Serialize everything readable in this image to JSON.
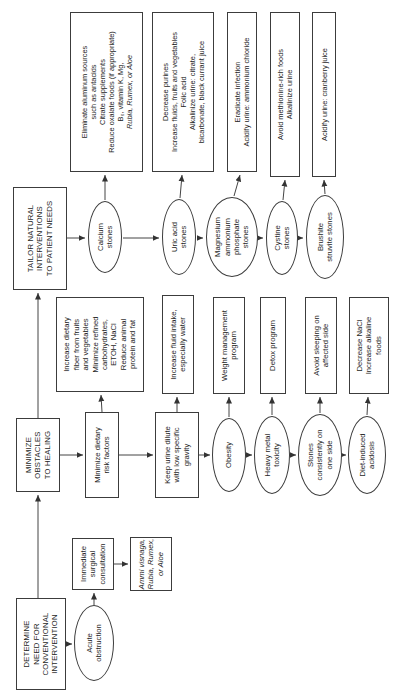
{
  "figure": {
    "background": "#ffffff",
    "line_color": "#3c3c3c"
  },
  "nodes": {
    "determine": {
      "shape": "rect",
      "lines": [
        "DETERMINE",
        "NEED FOR",
        "CONVENTIONAL",
        "INTERVENTION"
      ]
    },
    "minimize": {
      "shape": "rect",
      "lines": [
        "MINIMIZE",
        "OBSTACLES",
        "TO HEALING"
      ]
    },
    "tailor": {
      "shape": "rect",
      "lines": [
        "TAILOR NATURAL",
        "INTERVENTIONS",
        "TO PATIENT NEEDS"
      ]
    },
    "acute": {
      "shape": "ellipse",
      "lines": [
        "Acute",
        "obstruction"
      ]
    },
    "surgical": {
      "shape": "rect",
      "lines": [
        "Immediate",
        "surgical",
        "consultation"
      ]
    },
    "ammi": {
      "shape": "rect",
      "italic_lines": [
        0,
        1,
        2
      ],
      "lines": [
        "Ammi visnaga,",
        "Rubia, Rumex,",
        "or Aloe"
      ]
    },
    "dietary_risk": {
      "shape": "rect",
      "lines": [
        "Minimize dietary",
        "risk factors"
      ]
    },
    "fiber": {
      "shape": "rect",
      "lines": [
        "Increase dietary",
        "fiber from fruits",
        "and vegetables",
        "Minimize refined",
        "carbohydrates,",
        "ETOH, NaCl",
        "Reduce animal",
        "protein and fat"
      ]
    },
    "urine_dilute": {
      "shape": "rect",
      "lines": [
        "Keep urine dilute",
        "with low specific",
        "gravity"
      ]
    },
    "fluid": {
      "shape": "rect",
      "lines": [
        "Increase fluid intake,",
        "especially water"
      ]
    },
    "obesity": {
      "shape": "ellipse",
      "lines": [
        "Obesity"
      ]
    },
    "weight": {
      "shape": "rect",
      "lines": [
        "Weight management",
        "program"
      ]
    },
    "heavy_metal": {
      "shape": "ellipse",
      "lines": [
        "Heavy metal",
        "toxicity"
      ]
    },
    "detox": {
      "shape": "rect",
      "lines": [
        "Detox program"
      ]
    },
    "stones_side": {
      "shape": "ellipse",
      "lines": [
        "Stones",
        "consistently on",
        "one side"
      ]
    },
    "sleeping": {
      "shape": "rect",
      "lines": [
        "Avoid sleeping on",
        "affected side"
      ]
    },
    "acidosis": {
      "shape": "ellipse",
      "lines": [
        "Diet-induced",
        "acidosis"
      ]
    },
    "nacl": {
      "shape": "rect",
      "lines": [
        "Decrease NaCl",
        "Increase alkaline",
        "foods"
      ]
    },
    "calcium": {
      "shape": "ellipse",
      "lines": [
        "Calcium",
        "stones"
      ]
    },
    "eliminate": {
      "shape": "rect",
      "italic_lines": [
        5
      ],
      "lines": [
        "Eliminate aluminum sources",
        "such as antacids",
        "Citrate supplements",
        "Reduce oxalate foods (if appropriate)",
        "B₆, vitamin K, Mg,",
        "Rubia, Rumex, or Aloe"
      ]
    },
    "uric": {
      "shape": "ellipse",
      "lines": [
        "Uric acid",
        "stones"
      ]
    },
    "purines": {
      "shape": "rect",
      "lines": [
        "Decrease purines",
        "Increase fluids, fruits and vegetables",
        "Folic acid",
        "Alkalinize urine: citrate,",
        "bicarbonate, black currant juice"
      ]
    },
    "magnesium": {
      "shape": "ellipse",
      "lines": [
        "Magnesium",
        "ammonium",
        "phosphate",
        "stones"
      ]
    },
    "eradicate": {
      "shape": "rect",
      "lines": [
        "Eradicate infection",
        "Acidify urine: ammonium chloride"
      ]
    },
    "cystine": {
      "shape": "ellipse",
      "lines": [
        "Cystine",
        "stones"
      ]
    },
    "methionine": {
      "shape": "rect",
      "lines": [
        "Avoid methionine-rich foods",
        "Alkalinize urine"
      ]
    },
    "brushite": {
      "shape": "ellipse",
      "lines": [
        "Brushite",
        "struvite stones"
      ]
    },
    "cranberry": {
      "shape": "rect",
      "lines": [
        "Acidify urine: cranberry juice"
      ]
    }
  }
}
